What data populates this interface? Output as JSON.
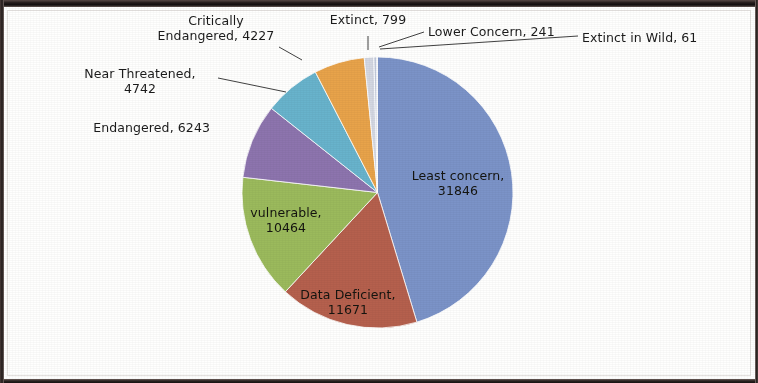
{
  "chart_data": {
    "type": "pie",
    "title": "",
    "subtitle": "",
    "xlabel": "",
    "ylabel": "",
    "legend_position": "none",
    "grid": false,
    "label_format": "{name}, {value}",
    "total": 70094,
    "start_angle_deg": 0,
    "direction": "clockwise",
    "categories": [
      "Least concern",
      "Data Deficient",
      "vulnerable",
      "Endangered",
      "Near Threatened",
      "Critically Endangered",
      "Extinct",
      "Lower Concern",
      "Extinct in Wild"
    ],
    "values": [
      31846,
      11671,
      10464,
      6243,
      4742,
      4227,
      799,
      241,
      61
    ],
    "colors": [
      "#7b93c8",
      "#b5604d",
      "#9bba5c",
      "#8d74ae",
      "#68b3cc",
      "#e8a34a",
      "#d3d7e2",
      "#c3cbdd",
      "#aeb9d2"
    ],
    "slices": [
      {
        "name": "Least concern",
        "value": 31846,
        "color": "#7b93c8",
        "label": "Least concern,\n31846",
        "label_placement": "inside"
      },
      {
        "name": "Data Deficient",
        "value": 11671,
        "color": "#b5604d",
        "label": "Data Deficient,\n11671",
        "label_placement": "inside"
      },
      {
        "name": "vulnerable",
        "value": 10464,
        "color": "#9bba5c",
        "label": "vulnerable,\n10464",
        "label_placement": "inside"
      },
      {
        "name": "Endangered",
        "value": 6243,
        "color": "#8d74ae",
        "label": "Endangered, 6243",
        "label_placement": "outside"
      },
      {
        "name": "Near Threatened",
        "value": 4742,
        "color": "#68b3cc",
        "label": "Near Threatened,\n4742",
        "label_placement": "outside-leader"
      },
      {
        "name": "Critically Endangered",
        "value": 4227,
        "color": "#e8a34a",
        "label": "Critically\nEndangered, 4227",
        "label_placement": "outside-leader"
      },
      {
        "name": "Extinct",
        "value": 799,
        "color": "#d3d7e2",
        "label": "Extinct, 799",
        "label_placement": "outside-leader"
      },
      {
        "name": "Lower Concern",
        "value": 241,
        "color": "#c3cbdd",
        "label": "Lower Concern, 241",
        "label_placement": "outside-leader"
      },
      {
        "name": "Extinct in Wild",
        "value": 61,
        "color": "#aeb9d2",
        "label": "Extinct in Wild, 61",
        "label_placement": "outside-leader"
      }
    ]
  },
  "labels": {
    "least_concern": "Least concern,\n31846",
    "data_deficient": "Data Deficient,\n11671",
    "vulnerable": "vulnerable,\n10464",
    "endangered": "Endangered, 6243",
    "near_threatened": "Near Threatened,\n4742",
    "critically_endangered": "Critically\nEndangered, 4227",
    "extinct": "Extinct, 799",
    "lower_concern": "Lower Concern, 241",
    "extinct_in_wild": "Extinct in Wild, 61"
  }
}
